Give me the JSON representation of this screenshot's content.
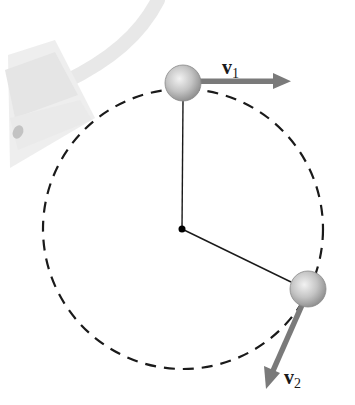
{
  "diagram": {
    "circle": {
      "cx": 183,
      "cy": 229,
      "r": 140,
      "style": "dashed",
      "color": "#1a1a1a"
    },
    "center_point": {
      "x": 182,
      "y": 229
    },
    "balls": [
      {
        "id": "ball-1",
        "cx": 183,
        "cy": 83,
        "r": 18
      },
      {
        "id": "ball-2",
        "cx": 308,
        "cy": 289,
        "r": 18
      }
    ],
    "vectors": [
      {
        "id": "v1",
        "symbol": "v",
        "subscript": "1",
        "from": [
          199,
          81
        ],
        "to": [
          291,
          81
        ],
        "color": "#7a7a7a"
      },
      {
        "id": "v2",
        "symbol": "v",
        "subscript": "2",
        "from": [
          302,
          305
        ],
        "to": [
          266,
          388
        ],
        "color": "#7a7a7a"
      }
    ],
    "labels": {
      "v1_main": "v",
      "v1_sub": "1",
      "v2_main": "v",
      "v2_sub": "2"
    },
    "decoration": "faded pendulum cone and rope at top-left"
  }
}
